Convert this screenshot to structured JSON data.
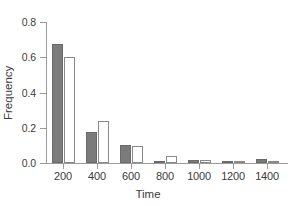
{
  "chart_data": {
    "type": "bar",
    "title": "",
    "subtitle": "",
    "xlabel": "Time",
    "ylabel": "Frequency",
    "categories": [
      "200",
      "400",
      "600",
      "800",
      "1000",
      "1200",
      "1400"
    ],
    "series": [
      {
        "name": "series-filled",
        "color": "#7b7b7b",
        "style": "filled",
        "values": [
          0.675,
          0.175,
          0.1,
          0.003,
          0.018,
          0.002,
          0.022
        ]
      },
      {
        "name": "series-hollow",
        "color": "#ffffff",
        "style": "hollow",
        "values": [
          0.603,
          0.24,
          0.095,
          0.042,
          0.015,
          0.007,
          0.003
        ]
      }
    ],
    "ylim": [
      0.0,
      0.8
    ],
    "yticks": [
      "0.0",
      "0.2",
      "0.4",
      "0.6",
      "0.8"
    ],
    "ytick_values": [
      0.0,
      0.2,
      0.4,
      0.6,
      0.8
    ],
    "grid": false,
    "legend": "none",
    "axis_color": "#9a9a9a",
    "text_color": "#3a3a3a"
  }
}
